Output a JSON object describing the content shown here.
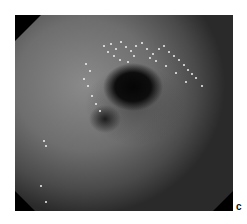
{
  "figure": {
    "panel_label": "c"
  }
}
